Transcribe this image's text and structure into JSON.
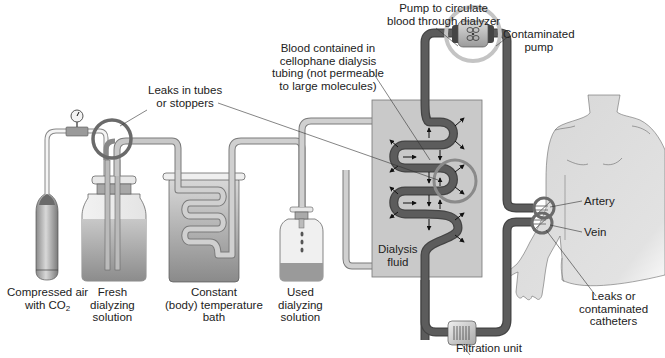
{
  "diagram": {
    "type": "apparatus-illustration",
    "colors": {
      "background": "#ffffff",
      "dark_tubing": "#555555",
      "light_tubing": "#c8c8c8",
      "dialysis_fluid": "#c9c9c9",
      "highlight_ring": "#7a7a7a",
      "body": "#dcdcdc"
    },
    "labels": {
      "compressed_air": {
        "line1": "Compressed air",
        "line2_prefix": "with CO",
        "line2_sub": "2"
      },
      "fresh_solution": {
        "line1": "Fresh",
        "line2": "dialyzing",
        "line3": "solution"
      },
      "temperature_bath": {
        "line1": "Constant",
        "line2": "(body) temperature",
        "line3": "bath"
      },
      "used_solution": {
        "line1": "Used",
        "line2": "dialyzing",
        "line3": "solution"
      },
      "dialysis_fluid": {
        "line1": "Dialysis",
        "line2": "fluid"
      },
      "leaks_tubes": {
        "line1": "Leaks in tubes",
        "line2": "or stoppers"
      },
      "blood_tubing": {
        "line1": "Blood contained in",
        "line2": "cellophane dialysis",
        "line3": "tubing (not permeable",
        "line4": "to large molecules)"
      },
      "pump": {
        "line1": "Pump to circulate",
        "line2": "blood through dialyzer"
      },
      "contaminated_pump": {
        "line1": "Contaminated",
        "line2": "pump"
      },
      "artery": "Artery",
      "vein": "Vein",
      "leaks_catheters": {
        "line1": "Leaks or",
        "line2": "contaminated",
        "line3": "catheters"
      },
      "filtration_unit": "Filtration unit"
    },
    "components": [
      "compressed-air-cylinder",
      "pressure-gauge",
      "fresh-dialyzing-solution-bottle",
      "constant-temperature-bath",
      "used-dialyzing-solution-bottle",
      "dialyzer-chamber",
      "blood-pump",
      "filtration-unit",
      "patient-torso-and-arm"
    ],
    "highlighted_problem_areas": [
      "Leaks in tubes or stoppers",
      "Dialysis tubing leak",
      "Contaminated pump",
      "Leaks or contaminated catheters"
    ]
  }
}
